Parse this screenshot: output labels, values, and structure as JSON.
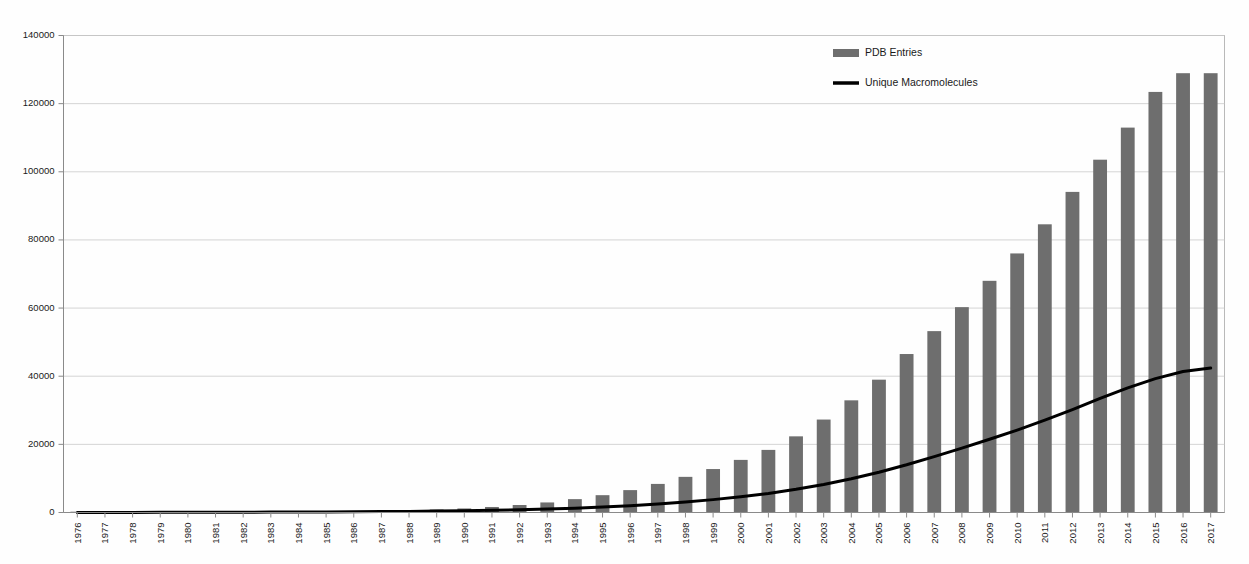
{
  "chart_data": {
    "type": "bar",
    "title": "",
    "xlabel": "",
    "ylabel": "",
    "ylim": [
      0,
      140000
    ],
    "grid": true,
    "legend_position": "top-right",
    "ytick_labels": [
      "0",
      "20000",
      "40000",
      "60000",
      "80000",
      "100000",
      "120000",
      "140000"
    ],
    "ytick_values": [
      0,
      20000,
      40000,
      60000,
      80000,
      100000,
      120000,
      140000
    ],
    "categories": [
      "1976",
      "1977",
      "1978",
      "1979",
      "1980",
      "1981",
      "1982",
      "1983",
      "1984",
      "1985",
      "1986",
      "1987",
      "1988",
      "1989",
      "1990",
      "1991",
      "1992",
      "1993",
      "1994",
      "1995",
      "1996",
      "1997",
      "1998",
      "1999",
      "2000",
      "2001",
      "2002",
      "2003",
      "2004",
      "2005",
      "2006",
      "2007",
      "2008",
      "2009",
      "2010",
      "2011",
      "2012",
      "2013",
      "2014",
      "2015",
      "2016",
      "2017"
    ],
    "series": [
      {
        "name": "PDB Entries",
        "render": "bar",
        "color": "#6e6e6e",
        "values": [
          13,
          20,
          35,
          52,
          71,
          97,
          135,
          186,
          243,
          309,
          388,
          489,
          627,
          869,
          1182,
          1617,
          2201,
          2953,
          3925,
          5084,
          6572,
          8392,
          10459,
          12752,
          15442,
          18372,
          22352,
          27278,
          32921,
          38982,
          46512,
          53235,
          60272,
          67998,
          76037,
          84588,
          94095,
          103547,
          112969,
          123442,
          128936,
          128936
        ]
      },
      {
        "name": "Unique Macromolecules",
        "render": "line",
        "color": "#000000",
        "values": [
          10,
          15,
          25,
          38,
          50,
          66,
          88,
          112,
          140,
          175,
          215,
          265,
          325,
          405,
          510,
          640,
          800,
          1000,
          1260,
          1580,
          1980,
          2470,
          3060,
          3780,
          4620,
          5600,
          6800,
          8200,
          9900,
          11800,
          14000,
          16400,
          18900,
          21500,
          24200,
          27100,
          30200,
          33500,
          36600,
          39300,
          41400,
          42400
        ]
      }
    ],
    "legend_entries": [
      {
        "label": "PDB Entries",
        "marker": "bar-swatch",
        "color": "#6e6e6e"
      },
      {
        "label": "Unique Macromolecules",
        "marker": "line-swatch",
        "color": "#000000"
      }
    ]
  },
  "colors": {
    "bar": "#6e6e6e",
    "line": "#000000",
    "grid": "#c9c9c9",
    "frame": "#b9b9b9",
    "background": "#fefefe",
    "text": "#1a1a1a"
  }
}
